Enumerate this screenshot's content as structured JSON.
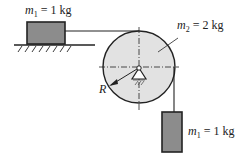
{
  "diagram": {
    "labels": {
      "m1_top": {
        "sym": "m",
        "sub": "1",
        "val": " = 1 kg"
      },
      "m2": {
        "sym": "m",
        "sub": "2",
        "val": " = 2 kg"
      },
      "m1_hang": {
        "sym": "m",
        "sub": "1",
        "val": " = 1 kg"
      },
      "radius": "R"
    },
    "colors": {
      "block": "#8c8c8c",
      "pulley": "#e2e2e2",
      "line": "#222222"
    }
  }
}
